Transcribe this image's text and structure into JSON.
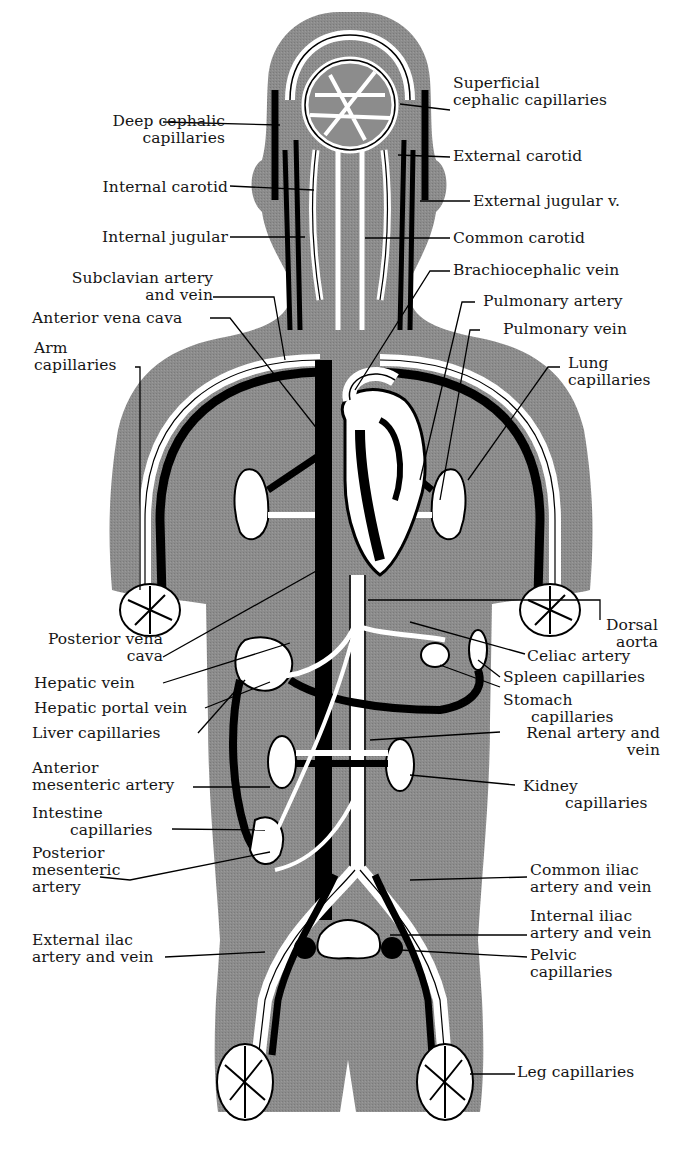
{
  "diagram": {
    "type": "anatomical-diagram",
    "colors": {
      "body_fill": "#8c8c8c",
      "artery": "#ffffff",
      "vein": "#0a0a0a",
      "outline": "#000000",
      "background": "#ffffff",
      "label_text": "#151515"
    },
    "labels_left": [
      {
        "id": "deep-cephalic-capillaries",
        "lines": [
          "Deep cephalic",
          "capillaries"
        ]
      },
      {
        "id": "internal-carotid",
        "lines": [
          "Internal carotid"
        ]
      },
      {
        "id": "internal-jugular",
        "lines": [
          "Internal jugular"
        ]
      },
      {
        "id": "subclavian-artery-and-vein",
        "lines": [
          "Subclavian artery",
          "and vein"
        ]
      },
      {
        "id": "anterior-vena-cava",
        "lines": [
          "Anterior vena cava"
        ]
      },
      {
        "id": "arm-capillaries",
        "lines": [
          "Arm",
          "capillaries"
        ]
      },
      {
        "id": "posterior-vena-cava",
        "lines": [
          "Posterior vena",
          "cava"
        ]
      },
      {
        "id": "hepatic-vein",
        "lines": [
          "Hepatic vein"
        ]
      },
      {
        "id": "hepatic-portal-vein",
        "lines": [
          "Hepatic portal vein"
        ]
      },
      {
        "id": "liver-capillaries",
        "lines": [
          "Liver capillaries"
        ]
      },
      {
        "id": "anterior-mesenteric-artery",
        "lines": [
          "Anterior",
          "mesenteric artery"
        ]
      },
      {
        "id": "intestine-capillaries",
        "lines": [
          "Intestine",
          "capillaries"
        ]
      },
      {
        "id": "posterior-mesenteric-artery",
        "lines": [
          "Posterior",
          "mesenteric",
          "artery"
        ]
      },
      {
        "id": "external-iliac-artery-and-vein",
        "lines": [
          "External ilac",
          "artery and vein"
        ]
      }
    ],
    "labels_right": [
      {
        "id": "superficial-cephalic-capillaries",
        "lines": [
          "Superficial",
          "cephalic capillaries"
        ]
      },
      {
        "id": "external-carotid",
        "lines": [
          "External carotid"
        ]
      },
      {
        "id": "external-jugular-v",
        "lines": [
          "External jugular v."
        ]
      },
      {
        "id": "common-carotid",
        "lines": [
          "Common carotid"
        ]
      },
      {
        "id": "brachiocephalic-vein",
        "lines": [
          "Brachiocephalic vein"
        ]
      },
      {
        "id": "pulmonary-artery",
        "lines": [
          "Pulmonary artery"
        ]
      },
      {
        "id": "pulmonary-vein",
        "lines": [
          "Pulmonary vein"
        ]
      },
      {
        "id": "lung-capillaries",
        "lines": [
          "Lung",
          "capillaries"
        ]
      },
      {
        "id": "dorsal-aorta",
        "lines": [
          "Dorsal",
          "aorta"
        ]
      },
      {
        "id": "celiac-artery",
        "lines": [
          "Celiac artery"
        ]
      },
      {
        "id": "spleen-capillaries",
        "lines": [
          "Spleen capillaries"
        ]
      },
      {
        "id": "stomach-capillaries",
        "lines": [
          "Stomach",
          "capillaries"
        ]
      },
      {
        "id": "renal-artery-and-vein",
        "lines": [
          "Renal artery and",
          "vein"
        ]
      },
      {
        "id": "kidney-capillaries",
        "lines": [
          "Kidney",
          "capillaries"
        ]
      },
      {
        "id": "common-iliac-artery-and-vein",
        "lines": [
          "Common iliac",
          "artery and vein"
        ]
      },
      {
        "id": "internal-iliac-artery-and-vein",
        "lines": [
          "Internal iliac",
          "artery and vein"
        ]
      },
      {
        "id": "pelvic-capillaries",
        "lines": [
          "Pelvic",
          "capillaries"
        ]
      },
      {
        "id": "leg-capillaries",
        "lines": [
          "Leg capillaries"
        ]
      }
    ]
  }
}
